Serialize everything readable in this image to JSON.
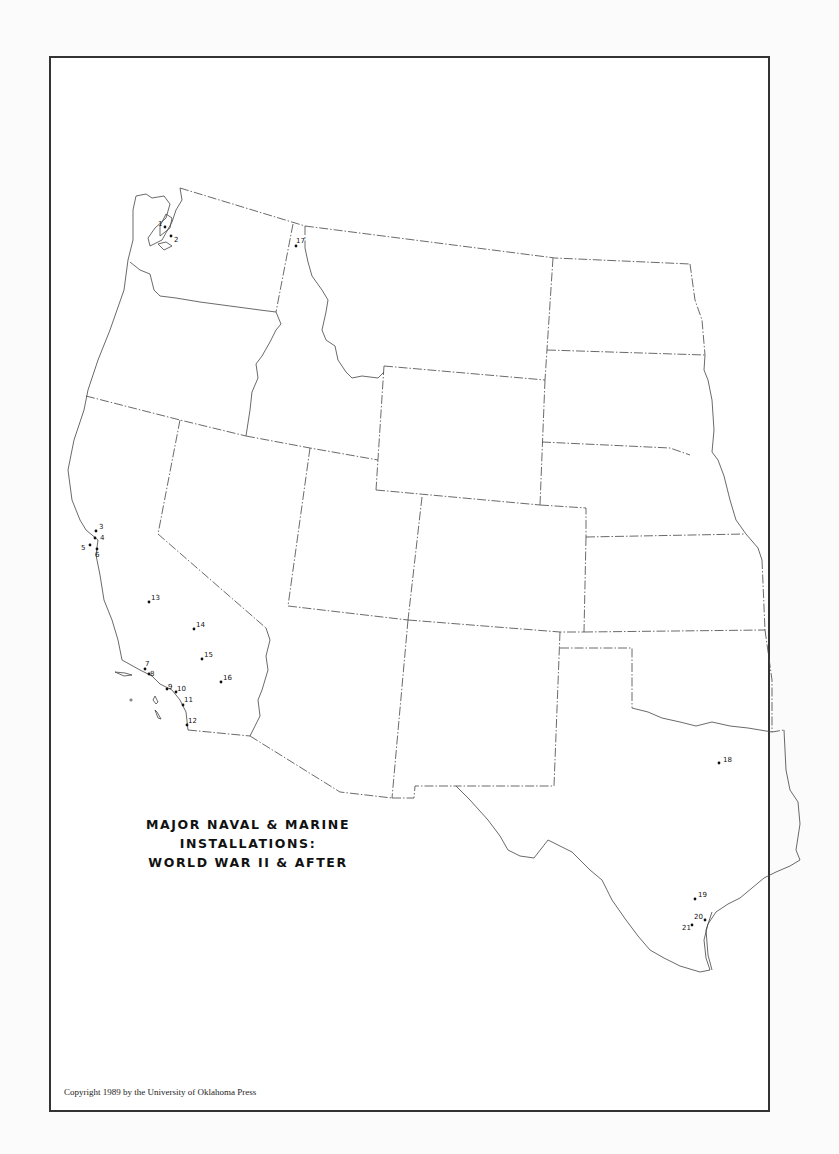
{
  "map": {
    "title_lines": [
      "MAJOR NAVAL & MARINE",
      "INSTALLATIONS:",
      "WORLD WAR II & AFTER"
    ],
    "copyright": "Copyright 1989 by the University of Oklahoma Press",
    "region": "Western United States",
    "installations": [
      {
        "id": "1",
        "label": "1",
        "x": 165,
        "y": 224
      },
      {
        "id": "2",
        "label": "2",
        "x": 172,
        "y": 237
      },
      {
        "id": "3",
        "label": "3",
        "x": 97,
        "y": 531
      },
      {
        "id": "4",
        "label": "4",
        "x": 96,
        "y": 537
      },
      {
        "id": "5",
        "label": "5",
        "x": 90,
        "y": 545
      },
      {
        "id": "6",
        "label": "6",
        "x": 96,
        "y": 552
      },
      {
        "id": "7",
        "label": "7",
        "x": 145,
        "y": 669
      },
      {
        "id": "8",
        "label": "8",
        "x": 149,
        "y": 674
      },
      {
        "id": "9",
        "label": "9",
        "x": 167,
        "y": 689
      },
      {
        "id": "10",
        "label": "10",
        "x": 176,
        "y": 692
      },
      {
        "id": "11",
        "label": "11",
        "x": 183,
        "y": 705
      },
      {
        "id": "12",
        "label": "12",
        "x": 187,
        "y": 723
      },
      {
        "id": "13",
        "label": "13",
        "x": 148,
        "y": 601
      },
      {
        "id": "14",
        "label": "14",
        "x": 194,
        "y": 628
      },
      {
        "id": "15",
        "label": "15",
        "x": 202,
        "y": 658
      },
      {
        "id": "16",
        "label": "16",
        "x": 221,
        "y": 682
      },
      {
        "id": "17",
        "label": "17",
        "x": 296,
        "y": 245
      },
      {
        "id": "18",
        "label": "18",
        "x": 719,
        "y": 762
      },
      {
        "id": "19",
        "label": "19",
        "x": 695,
        "y": 898
      },
      {
        "id": "20",
        "label": "20",
        "x": 698,
        "y": 918
      },
      {
        "id": "21",
        "label": "21",
        "x": 692,
        "y": 924
      }
    ]
  }
}
